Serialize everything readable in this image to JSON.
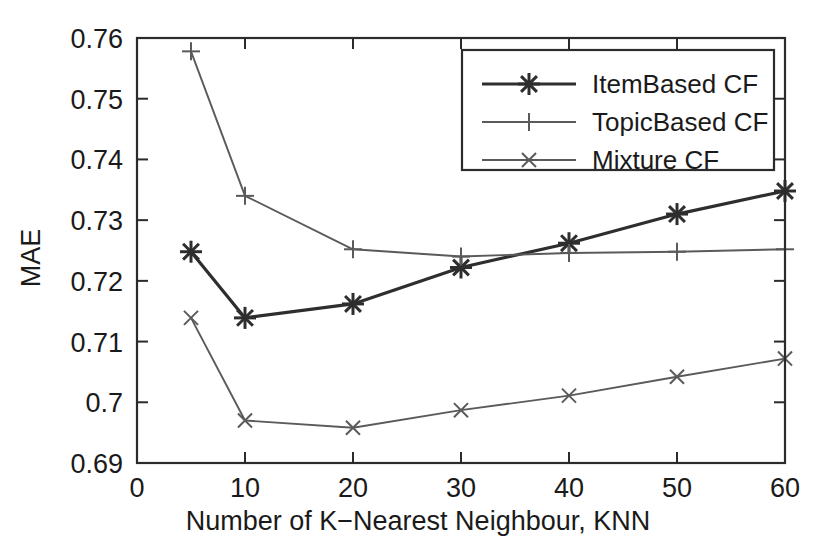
{
  "chart_data": {
    "type": "line",
    "title": "",
    "xlabel": "Number of K−Nearest Neighbour, KNN",
    "ylabel": "MAE",
    "xlim": [
      0,
      60
    ],
    "ylim": [
      0.69,
      0.76
    ],
    "x": [
      5,
      10,
      20,
      30,
      40,
      50,
      60
    ],
    "xticks": [
      0,
      10,
      20,
      30,
      40,
      50,
      60
    ],
    "xticklabels": [
      "0",
      "10",
      "20",
      "30",
      "40",
      "50",
      "60"
    ],
    "yticks": [
      0.69,
      0.7,
      0.71,
      0.72,
      0.73,
      0.74,
      0.75,
      0.76
    ],
    "yticklabels": [
      "0.69",
      "0.7",
      "0.71",
      "0.72",
      "0.73",
      "0.74",
      "0.75",
      "0.76"
    ],
    "grid": false,
    "legend_position": "upper right",
    "series": [
      {
        "name": "ItemBased CF",
        "marker": "asterisk",
        "color": "#2e2e2e",
        "values": [
          0.7248,
          0.7139,
          0.7162,
          0.7222,
          0.7262,
          0.731,
          0.7348
        ]
      },
      {
        "name": "TopicBased CF",
        "marker": "plus",
        "color": "#5a5a5a",
        "values": [
          0.7578,
          0.734,
          0.7252,
          0.724,
          0.7246,
          0.7248,
          0.7252
        ]
      },
      {
        "name": "Mixture CF",
        "marker": "cross",
        "color": "#5a5a5a",
        "values": [
          0.7139,
          0.697,
          0.6958,
          0.6987,
          0.7011,
          0.7042,
          0.7072
        ]
      }
    ]
  },
  "axes": {
    "y_axis_title": "MAE",
    "x_axis_title": "Number of K−Nearest Neighbour, KNN"
  },
  "legend": {
    "entries": [
      {
        "label": "ItemBased CF",
        "marker": "asterisk"
      },
      {
        "label": "TopicBased CF",
        "marker": "plus"
      },
      {
        "label": "Mixture CF",
        "marker": "cross"
      }
    ]
  },
  "colors": {
    "axis": "#2b2b2b",
    "primary_series": "#2e2e2e",
    "secondary_series": "#5a5a5a",
    "background": "#ffffff"
  }
}
